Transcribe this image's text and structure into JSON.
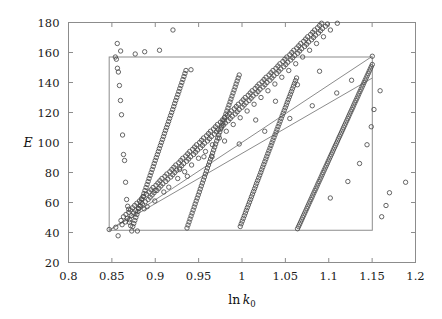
{
  "figure": {
    "background": "#ffffff",
    "frame_color": "#8c8c8c",
    "marker_color": "#4a4a4a",
    "band_color": "#8c8c8c",
    "width": 442,
    "height": 319
  },
  "axes": {
    "x_title_prefix": "ln",
    "x_title_symbol": "k",
    "x_title_subscript": "0",
    "y_title": "E",
    "x_tick_labels": [
      "0.8",
      "0.85",
      "0.9",
      "0.95",
      "1",
      "1.05",
      "1.1",
      "1.15",
      "1.2"
    ],
    "y_tick_labels": [
      "20",
      "40",
      "60",
      "80",
      "100",
      "120",
      "140",
      "160",
      "180"
    ]
  },
  "chart_data": {
    "type": "scatter",
    "title": "",
    "xlabel": "ln k0",
    "ylabel": "E",
    "xlim": [
      0.8,
      1.2
    ],
    "ylim": [
      20,
      180
    ],
    "xticks": [
      0.8,
      0.85,
      0.9,
      0.95,
      1.0,
      1.05,
      1.1,
      1.15,
      1.2
    ],
    "yticks": [
      20,
      40,
      60,
      80,
      100,
      120,
      140,
      160,
      180
    ],
    "grid": false,
    "legend": null,
    "marker": "open-circle",
    "marker_size_px": 4.4,
    "annotations": [
      {
        "name": "reference-rectangle",
        "type": "rectangle",
        "x0": 0.8469,
        "y0": 41.5,
        "x1": 1.1502,
        "y1": 157.0,
        "stroke": "#8c8c8c",
        "fill": "none"
      },
      {
        "name": "band-upper-bound",
        "type": "line",
        "x0": 0.8469,
        "y0": 41.5,
        "x1": 1.1502,
        "y1": 157.5,
        "stroke": "#8c8c8c"
      },
      {
        "name": "band-lower-bound",
        "type": "line",
        "x0": 0.8469,
        "y0": 41.5,
        "x1": 1.1502,
        "y1": 143.0,
        "stroke": "#8c8c8c"
      }
    ],
    "x": [
      0.8469,
      0.8545,
      0.8572,
      0.8605,
      0.8618,
      0.8634,
      0.8655,
      0.8662,
      0.8678,
      0.8695,
      0.8702,
      0.8714,
      0.8726,
      0.8738,
      0.8751,
      0.8762,
      0.8775,
      0.8788,
      0.8794,
      0.8806,
      0.8818,
      0.8829,
      0.8841,
      0.8852,
      0.8864,
      0.8872,
      0.8885,
      0.8898,
      0.8906,
      0.8918,
      0.8929,
      0.8941,
      0.8952,
      0.8964,
      0.8975,
      0.8986,
      0.8995,
      0.9008,
      0.9019,
      0.9031,
      0.9042,
      0.9054,
      0.9065,
      0.9077,
      0.9088,
      0.9099,
      0.9111,
      0.9122,
      0.9134,
      0.9145,
      0.9156,
      0.9168,
      0.9179,
      0.9191,
      0.9202,
      0.9214,
      0.9225,
      0.9237,
      0.9248,
      0.9259,
      0.9271,
      0.9282,
      0.9294,
      0.9305,
      0.9317,
      0.9328,
      0.9339,
      0.9351,
      0.9362,
      0.9374,
      0.9385,
      0.9397,
      0.9408,
      0.9419,
      0.9431,
      0.9442,
      0.9454,
      0.9465,
      0.9477,
      0.9488,
      0.9499,
      0.9511,
      0.9522,
      0.9534,
      0.9545,
      0.9557,
      0.9568,
      0.9579,
      0.9591,
      0.9602,
      0.9614,
      0.9625,
      0.9637,
      0.9648,
      0.9659,
      0.9671,
      0.9682,
      0.9694,
      0.9705,
      0.9717,
      0.9728,
      0.9739,
      0.9751,
      0.9762,
      0.9774,
      0.9785,
      0.9797,
      0.9808,
      0.9819,
      0.9831,
      0.9842,
      0.9854,
      0.9865,
      0.9877,
      0.9888,
      0.9899,
      0.9911,
      0.9922,
      0.9934,
      0.9945,
      0.9957,
      0.9968,
      0.9979,
      0.9991,
      1.0002,
      1.0014,
      1.0025,
      1.0037,
      1.0048,
      1.0059,
      1.0071,
      1.0082,
      1.0094,
      1.0105,
      1.0117,
      1.0128,
      1.0139,
      1.0151,
      1.0162,
      1.0174,
      1.0185,
      1.0197,
      1.0208,
      1.0219,
      1.0231,
      1.0242,
      1.0254,
      1.0265,
      1.0277,
      1.0288,
      1.0299,
      1.0311,
      1.0322,
      1.0334,
      1.0345,
      1.0357,
      1.0368,
      1.0379,
      1.0391,
      1.0402,
      1.0414,
      1.0425,
      1.0437,
      1.0448,
      1.0459,
      1.0471,
      1.0482,
      1.0494,
      1.0505,
      1.0517,
      1.0528,
      1.0539,
      1.0551,
      1.0562,
      1.0574,
      1.0585,
      1.0597,
      1.0608,
      1.0619,
      1.0631,
      1.0642,
      1.0654,
      1.0665,
      1.0677,
      1.0688,
      1.0699,
      1.0711,
      1.0722,
      1.0734,
      1.0745,
      1.0757,
      1.0768,
      1.0779,
      1.0791,
      1.0802,
      1.0814,
      1.0825,
      1.0837,
      1.0848,
      1.0859,
      1.0871,
      1.0882,
      1.0894,
      1.0905,
      1.0917,
      1.0928,
      1.0939,
      1.0951,
      1.0962,
      1.0974,
      1.0985,
      1.0997,
      1.1008,
      1.1019,
      1.1031,
      1.1042,
      1.1054,
      1.1065,
      1.1077,
      1.1088,
      1.1099,
      1.1111,
      1.1122,
      1.1134,
      1.1145,
      1.1157,
      1.1168,
      1.1179,
      1.1191,
      1.1202,
      1.1214,
      1.1225,
      1.1237,
      1.1248,
      1.1259,
      1.1271,
      1.1282,
      1.1294,
      1.1305,
      1.1317,
      1.1328,
      1.1339,
      1.1351,
      1.1362,
      1.1374,
      1.1385,
      1.1397,
      1.1408,
      1.1419,
      1.1431,
      1.1442,
      1.1454,
      1.1465,
      1.1477,
      1.1488,
      1.1499,
      1.1502,
      1.1502,
      1.149,
      1.1478,
      1.1466,
      1.1455,
      1.1443,
      1.1431,
      1.1419,
      1.1407,
      1.1396,
      1.1384,
      1.1372,
      1.136,
      1.1348,
      1.1337,
      1.1325,
      1.1313,
      1.1301,
      1.1289,
      1.1278,
      1.1266,
      1.1254,
      1.1242,
      1.123,
      1.1219,
      1.1207,
      1.1195,
      1.1183,
      1.1171,
      1.116,
      1.1148,
      1.1136,
      1.1124,
      1.1112,
      1.1101,
      1.1089,
      1.1077,
      1.1065,
      1.1053,
      1.1042,
      1.103,
      1.1018,
      1.1006,
      1.0994,
      1.0983,
      1.0971,
      1.0959,
      1.0947,
      1.0935,
      1.0924,
      1.0912,
      1.09,
      1.0888,
      1.0876,
      1.0865,
      1.0853,
      1.0841,
      1.0829,
      1.0817,
      1.0806,
      1.0794,
      1.0782,
      1.077,
      1.0758,
      1.0747,
      1.0735,
      1.0723,
      1.0711,
      1.0699,
      1.0688,
      1.0676,
      1.0664,
      1.0652,
      1.064,
      1.0629,
      1.0617,
      1.0605,
      1.0593,
      1.0581,
      1.057,
      1.0558,
      1.0546,
      1.0534,
      1.0522,
      1.0511,
      1.0499,
      1.0487,
      1.0475,
      1.0463,
      1.0452,
      1.044,
      1.0428,
      1.0416,
      1.0404,
      1.0393,
      1.0381,
      1.0369,
      1.0357,
      1.0345,
      1.0334,
      1.0322,
      1.031,
      1.0298,
      1.0286,
      1.0275,
      1.0263,
      1.0251,
      1.0239,
      1.0227,
      1.0216,
      1.0204,
      1.0192,
      1.018,
      1.0168,
      1.0157,
      1.0145,
      1.0133,
      1.0121,
      1.0109,
      1.0098,
      1.0086,
      1.0074,
      1.0062,
      1.005,
      1.0039,
      1.0027,
      1.0015,
      1.0003,
      0.9991,
      0.998,
      0.9968,
      0.9956,
      0.9944,
      0.9932,
      0.9921,
      0.9909,
      0.9897,
      0.9885,
      0.9873,
      0.9862,
      0.985,
      0.9838,
      0.9826,
      0.9814,
      0.9803,
      0.9791,
      0.9779,
      0.9767,
      0.9755,
      0.9744,
      0.9732,
      0.972,
      0.9708,
      0.9696,
      0.9685,
      0.9673,
      0.9661,
      0.9649,
      0.9637,
      0.9626,
      0.9614,
      0.9602,
      0.959,
      0.9578,
      0.9567,
      0.9555,
      0.9543,
      0.9531,
      0.9519,
      0.9508,
      0.9496,
      0.9484,
      0.9472,
      0.946,
      0.9449,
      0.9437,
      0.9425,
      0.9413,
      0.9401,
      0.939,
      0.9378,
      0.9366,
      0.9354,
      0.9342,
      0.9331,
      0.9319,
      0.9307,
      0.9295,
      0.9283,
      0.9272,
      0.926,
      0.9248,
      0.9236,
      0.9224,
      0.9213,
      0.9201,
      0.9189,
      0.9177,
      0.9165,
      0.9154,
      0.9142,
      0.913,
      0.9118,
      0.9106,
      0.9095,
      0.9083,
      0.9071,
      0.9059,
      0.9047,
      0.9036,
      0.9024,
      0.9012,
      0.9,
      0.8988,
      0.8977,
      0.8965,
      0.8953,
      0.8941,
      0.8929,
      0.8918,
      0.8906,
      0.8894,
      0.8882,
      0.887,
      0.8859,
      0.8847,
      0.8835,
      0.8823,
      0.8811,
      0.88,
      0.8788,
      0.8776,
      0.8764,
      0.8752,
      0.8741,
      0.8729,
      0.8717,
      0.8705,
      0.8693,
      0.8682,
      0.867,
      0.8658,
      0.8646,
      0.8634,
      0.8623,
      0.8611,
      0.8599,
      0.8587,
      0.8575,
      0.8564,
      0.8552,
      0.854,
      0.8769,
      0.8878,
      0.8562,
      0.8601,
      0.9049,
      0.9204,
      0.8997,
      0.937,
      0.9561,
      0.9799,
      1.0158,
      1.0386,
      1.0639,
      1.0894,
      1.1018,
      1.122,
      1.1355,
      1.1441,
      1.149,
      1.1521,
      1.1592,
      1.161,
      1.166,
      1.17,
      1.1886,
      0.9281,
      0.9655,
      0.9968,
      1.0262,
      1.0551,
      1.081,
      1.1092,
      1.1263,
      0.9412,
      0.9728,
      1.003,
      1.0331,
      1.062,
      1.0876,
      1.1135,
      0.892,
      0.9124,
      0.9336,
      0.9534,
      0.9742,
      0.9955,
      1.0161,
      1.0369,
      1.0577,
      1.0783,
      1.0989,
      1.1177,
      1.134
    ],
    "y": [
      42.0,
      43.5,
      37.8,
      48.0,
      45.2,
      50.5,
      47.0,
      52.0,
      49.5,
      53.5,
      46.8,
      55.0,
      51.2,
      56.5,
      53.0,
      58.0,
      54.5,
      59.5,
      41.0,
      56.0,
      61.0,
      57.5,
      62.5,
      59.0,
      64.0,
      55.8,
      60.5,
      65.5,
      57.2,
      62.0,
      67.0,
      63.5,
      68.5,
      65.0,
      70.0,
      66.5,
      61.0,
      71.5,
      68.0,
      73.0,
      69.5,
      74.5,
      71.0,
      76.0,
      72.5,
      67.0,
      77.5,
      74.0,
      79.0,
      75.5,
      70.2,
      80.5,
      77.0,
      82.0,
      78.5,
      83.5,
      80.0,
      85.0,
      81.5,
      76.0,
      86.5,
      83.0,
      88.0,
      84.5,
      89.5,
      86.0,
      80.5,
      91.0,
      87.5,
      92.5,
      89.0,
      94.0,
      90.5,
      85.0,
      95.5,
      92.0,
      97.0,
      93.5,
      98.5,
      95.0,
      89.5,
      100.0,
      96.5,
      101.5,
      98.0,
      103.0,
      99.5,
      94.0,
      104.5,
      101.0,
      106.0,
      102.5,
      107.5,
      104.0,
      98.5,
      109.0,
      105.5,
      110.5,
      107.0,
      112.0,
      108.5,
      103.0,
      113.5,
      110.0,
      115.0,
      111.5,
      116.5,
      113.0,
      107.5,
      118.0,
      114.5,
      119.5,
      116.0,
      121.0,
      117.5,
      112.0,
      122.5,
      119.0,
      124.0,
      120.5,
      125.5,
      122.0,
      116.5,
      127.0,
      123.5,
      128.5,
      125.0,
      130.0,
      126.5,
      121.0,
      131.5,
      128.0,
      133.0,
      129.5,
      134.5,
      131.0,
      125.5,
      136.0,
      132.5,
      137.5,
      134.0,
      139.0,
      135.5,
      130.0,
      140.5,
      137.0,
      142.0,
      138.5,
      143.5,
      140.0,
      134.5,
      145.0,
      141.5,
      146.5,
      143.0,
      148.0,
      144.5,
      139.0,
      149.5,
      146.0,
      151.0,
      147.5,
      152.5,
      149.0,
      143.5,
      154.0,
      150.5,
      155.5,
      152.0,
      157.0,
      153.5,
      148.0,
      158.5,
      155.0,
      160.0,
      156.5,
      161.5,
      158.0,
      152.5,
      163.0,
      159.5,
      164.5,
      161.0,
      166.0,
      162.5,
      157.0,
      167.5,
      164.0,
      169.0,
      165.5,
      170.5,
      167.0,
      161.5,
      172.0,
      168.5,
      173.5,
      170.0,
      175.0,
      171.5,
      166.0,
      176.5,
      173.0,
      178.0,
      174.5,
      179.5,
      176.0,
      170.5,
      181.0,
      177.5,
      182.5,
      179.0,
      184.0,
      180.5,
      175.0,
      185.5,
      182.0,
      187.0,
      183.5,
      188.5,
      185.0,
      179.5,
      190.0,
      186.5,
      191.5,
      188.0,
      193.0,
      189.5,
      184.0,
      194.5,
      191.0,
      196.0,
      192.5,
      197.5,
      194.0,
      188.5,
      199.0,
      195.5,
      200.5,
      197.0,
      202.0,
      198.5,
      193.0,
      203.5,
      200.0,
      205.0,
      201.5,
      206.5,
      203.0,
      197.5,
      208.0,
      204.5,
      209.5,
      206.0,
      211.0,
      207.5,
      202.0,
      157.5,
      152.0,
      150.5,
      149.0,
      147.5,
      146.0,
      144.5,
      143.0,
      141.5,
      140.0,
      138.5,
      137.0,
      135.5,
      134.0,
      132.5,
      131.0,
      129.5,
      128.0,
      126.5,
      125.0,
      123.5,
      122.0,
      120.5,
      119.0,
      117.5,
      116.0,
      114.5,
      113.0,
      111.5,
      110.0,
      108.5,
      107.0,
      105.5,
      104.0,
      102.5,
      101.0,
      99.5,
      98.0,
      96.5,
      95.0,
      93.5,
      92.0,
      90.5,
      89.0,
      87.5,
      86.0,
      84.5,
      83.0,
      81.5,
      80.0,
      78.5,
      77.0,
      75.5,
      74.0,
      72.5,
      71.0,
      69.5,
      68.0,
      66.5,
      65.0,
      63.5,
      62.0,
      60.5,
      59.0,
      57.5,
      56.0,
      54.5,
      53.0,
      51.5,
      50.0,
      48.5,
      47.0,
      45.5,
      44.0,
      42.5,
      143.0,
      141.2,
      139.4,
      137.6,
      135.8,
      134.0,
      132.2,
      130.4,
      128.6,
      126.8,
      125.0,
      123.2,
      121.4,
      119.6,
      117.8,
      116.0,
      114.2,
      112.4,
      110.6,
      108.8,
      107.0,
      105.2,
      103.4,
      101.6,
      99.8,
      98.0,
      96.2,
      94.4,
      92.6,
      90.8,
      89.0,
      87.2,
      85.4,
      83.6,
      81.8,
      80.0,
      78.2,
      76.4,
      74.6,
      72.8,
      71.0,
      69.2,
      67.4,
      65.6,
      63.8,
      62.0,
      60.2,
      58.4,
      56.6,
      54.8,
      53.0,
      51.2,
      49.4,
      47.6,
      45.8,
      44.0,
      145.0,
      143.0,
      141.0,
      139.0,
      137.0,
      135.0,
      133.0,
      131.0,
      129.0,
      127.0,
      125.0,
      123.0,
      121.0,
      119.0,
      117.0,
      115.0,
      113.0,
      111.0,
      109.0,
      107.0,
      105.0,
      103.0,
      101.0,
      99.0,
      97.0,
      95.0,
      93.0,
      91.0,
      89.0,
      87.0,
      85.0,
      83.0,
      81.0,
      79.0,
      77.0,
      75.0,
      73.0,
      71.0,
      69.0,
      67.0,
      65.0,
      63.0,
      61.0,
      59.0,
      57.0,
      55.0,
      53.0,
      51.0,
      49.0,
      47.0,
      45.0,
      43.0,
      148.0,
      146.0,
      144.0,
      142.0,
      140.0,
      138.0,
      136.0,
      134.0,
      132.0,
      130.0,
      128.0,
      126.0,
      124.0,
      122.0,
      120.0,
      118.0,
      116.0,
      114.0,
      112.0,
      110.0,
      108.0,
      106.0,
      104.0,
      102.0,
      100.0,
      98.0,
      96.0,
      94.0,
      92.0,
      90.0,
      88.0,
      86.0,
      84.0,
      82.0,
      80.0,
      78.0,
      76.0,
      74.0,
      72.0,
      70.0,
      68.0,
      66.0,
      64.0,
      62.0,
      60.0,
      58.0,
      56.0,
      54.0,
      52.0,
      50.0,
      48.0,
      46.0,
      44.0,
      41.0,
      44.5,
      48.5,
      55.5,
      57.5,
      62.0,
      73.5,
      88.0,
      92.0,
      105.0,
      118.5,
      128.0,
      138.0,
      147.0,
      149.5,
      155.5,
      157.0,
      159.0,
      160.5,
      166.0,
      161.0,
      161.5,
      175.0,
      68.0,
      77.5,
      90.5,
      101.0,
      115.0,
      127.5,
      138.5,
      147.5,
      63.0,
      74.0,
      86.0,
      98.5,
      110.5,
      122.0,
      134.5,
      50.5,
      58.0,
      66.5,
      73.5,
      82.0,
      90.5,
      99.0,
      107.5,
      116.0,
      124.5,
      133.0,
      141.5,
      148.5
    ]
  }
}
